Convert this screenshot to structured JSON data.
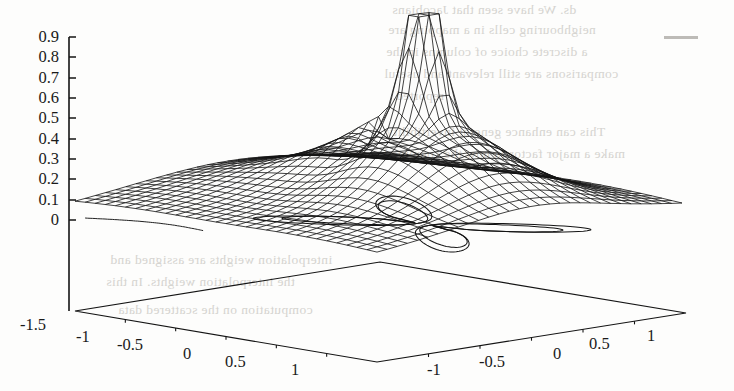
{
  "figure": {
    "kind": "3d-mesh-surface-with-contour-base",
    "background_color": "#fdfdfc",
    "line_color": "#141414",
    "ghost_text_color": "#cfcdc9",
    "dash_mark_color": "#bdbbb7"
  },
  "chart_data": {
    "type": "surface",
    "title": "",
    "xlabel": "",
    "ylabel": "",
    "zlabel": "",
    "projection": "3d-wireframe-mesh",
    "grid": false,
    "legend": null,
    "z_axis": {
      "tick_labels": [
        "0.9",
        "0.8",
        "0.7",
        "0.6",
        "0.5",
        "0.4",
        "0.3",
        "0.2",
        "0.1",
        "0"
      ],
      "tick_values": [
        0.9,
        0.8,
        0.7,
        0.6,
        0.5,
        0.4,
        0.3,
        0.2,
        0.1,
        0
      ],
      "zlim": [
        0,
        0.9
      ],
      "position": "left"
    },
    "x_axis": {
      "tick_labels": [
        "-1.5",
        "-1",
        "-0.5",
        "0",
        "0.5",
        "1"
      ],
      "tick_values": [
        -1.5,
        -1,
        -0.5,
        0,
        0.5,
        1
      ],
      "xlim": [
        -1.5,
        1.5
      ],
      "edge": "front-left"
    },
    "y_axis": {
      "tick_labels": [
        "-1",
        "-0.5",
        "0",
        "0.5",
        "1"
      ],
      "tick_values": [
        -1,
        -0.5,
        0,
        0.5,
        1
      ],
      "ylim": [
        -1.5,
        1.5
      ],
      "edge": "front-right"
    },
    "surface": {
      "description": "Broad low plateau near z=0.1 rising to a single very sharp narrow spike near z=0.9 located right of centre; saddle-like ridges fall off toward the four corners.",
      "peak_value": 0.9,
      "plateau_value": 0.1,
      "mesh_divisions_u": 30,
      "mesh_divisions_v": 30,
      "peak_x": 0.35,
      "peak_y": 0.1
    },
    "contour_base": {
      "description": "Contour lines projected on the base plane forming two opposing lobes meeting at a narrow waist near the centre (butterfly / hourglass shape).",
      "levels": 3
    }
  },
  "annotations": {
    "dash_mark": {
      "label": "",
      "x": 664,
      "y": 36,
      "width": 34
    }
  },
  "ghost_text": {
    "note": "faint show-through text from the reverse of the scanned page",
    "lines": [
      {
        "text": "ds. We have seen that Jacobians",
        "x": 392,
        "y": 2
      },
      {
        "text": "neighbouring cells in a mapping are",
        "x": 388,
        "y": 22
      },
      {
        "text": "a discrete choice of columns in the",
        "x": 386,
        "y": 44
      },
      {
        "text": "comparisons are still relevant and useful",
        "x": 384,
        "y": 66
      },
      {
        "text": "reported.",
        "x": 392,
        "y": 88
      },
      {
        "text": "This can enhance general invertibility",
        "x": 386,
        "y": 124
      },
      {
        "text": "make a major factor in how the computed",
        "x": 384,
        "y": 146
      },
      {
        "text": "interpolation weights are assigned and",
        "x": 110,
        "y": 252
      },
      {
        "text": "the interpolation weights. In this",
        "x": 106,
        "y": 274
      },
      {
        "text": "computation on the scattered data",
        "x": 118,
        "y": 302
      }
    ]
  },
  "z_ticks": [
    {
      "label": "0.9",
      "y": 27
    },
    {
      "label": "0.8",
      "y": 47
    },
    {
      "label": "0.7",
      "y": 68
    },
    {
      "label": "0.6",
      "y": 88
    },
    {
      "label": "0.5",
      "y": 108
    },
    {
      "label": "0.4",
      "y": 129
    },
    {
      "label": "0.3",
      "y": 149
    },
    {
      "label": "0.2",
      "y": 169
    },
    {
      "label": "0.1",
      "y": 190
    },
    {
      "label": "0",
      "y": 210
    }
  ],
  "x_ticks": [
    {
      "label": "-1.5",
      "x": 20,
      "y": 315
    },
    {
      "label": "-1",
      "x": 76,
      "y": 327
    },
    {
      "label": "-0.5",
      "x": 117,
      "y": 335
    },
    {
      "label": "0",
      "x": 183,
      "y": 344
    },
    {
      "label": "0.5",
      "x": 225,
      "y": 352
    },
    {
      "label": "1",
      "x": 291,
      "y": 360
    }
  ],
  "y_ticks": [
    {
      "label": "-1",
      "x": 427,
      "y": 360
    },
    {
      "label": "-0.5",
      "x": 479,
      "y": 352
    },
    {
      "label": "0",
      "x": 553,
      "y": 344
    },
    {
      "label": "0.5",
      "x": 589,
      "y": 334
    },
    {
      "label": "1",
      "x": 647,
      "y": 326
    }
  ]
}
